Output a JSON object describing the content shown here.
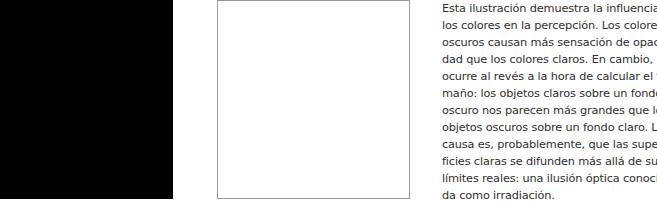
{
  "figure": {
    "dark_square": {
      "color": "#000000"
    },
    "light_square": {
      "color": "#ffffff",
      "border": "#9a9a9a"
    }
  },
  "caption": {
    "lines": [
      "Esta ilustración demuestra la influencia de",
      "los colores en la percepción. Los colores",
      "oscuros causan más sensación de opaci-",
      "dad que los colores claros. En cambio,",
      "ocurre al revés a la hora de calcular el ta-",
      "maño: los objetos claros sobre un fondo",
      "oscuro nos parecen más grandes que los",
      "objetos oscuros sobre un fondo claro. La",
      "causa es, probablemente, que las super-",
      "ficies claras se difunden más allá de sus",
      "límites reales: una ilusión óptica conoci-",
      "da como irradiación."
    ]
  }
}
